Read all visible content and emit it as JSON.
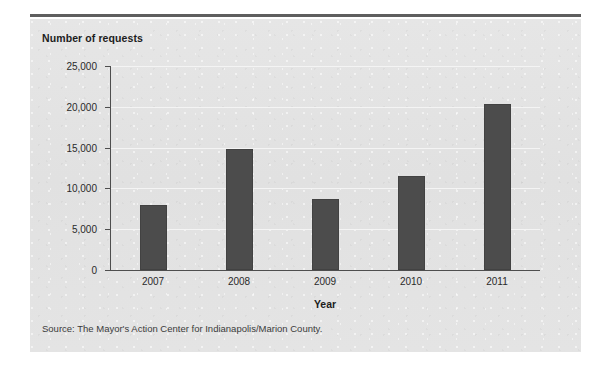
{
  "figure": {
    "clipped_header_text": "",
    "y_axis_title": "Number of requests",
    "x_axis_title": "Year",
    "source_note": "Source: The Mayor's Action Center for Indianapolis/Marion County.",
    "colors": {
      "bar": "#4c4c4c",
      "panel_background": "#e3e3e3",
      "gridline": "#f4f4f4",
      "axis": "#4e4e4e",
      "top_rule": "#5e5e5e",
      "text": "#1d1d1d"
    }
  },
  "chart_data": {
    "type": "bar",
    "title": "",
    "xlabel": "Year",
    "ylabel": "Number of requests",
    "categories": [
      "2007",
      "2008",
      "2009",
      "2010",
      "2011"
    ],
    "values": [
      8000,
      14800,
      8700,
      11500,
      20400
    ],
    "ylim": [
      0,
      25000
    ],
    "ytick_values": [
      0,
      5000,
      10000,
      15000,
      20000,
      25000
    ],
    "ytick_labels": [
      "0",
      "5,000",
      "10,000",
      "15,000",
      "20,000",
      "25,000"
    ],
    "grid": true,
    "legend": false,
    "series": [
      {
        "name": "Number of requests",
        "values": [
          8000,
          14800,
          8700,
          11500,
          20400
        ]
      }
    ],
    "source": "Source: The Mayor's Action Center for Indianapolis/Marion County."
  }
}
